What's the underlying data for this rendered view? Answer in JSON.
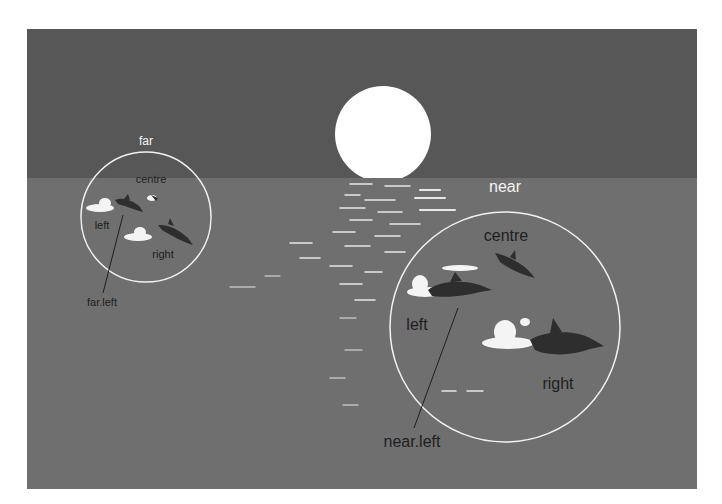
{
  "colors": {
    "background": "#ffffff",
    "sky": "#575757",
    "sea": "#6f6f6f",
    "sun": "#ffffff",
    "circle_stroke": "#f2f2f2",
    "label_dark": "#1e1e1e",
    "label_light": "#f5f5f5",
    "dolphin": "#2e2e2e",
    "splash": "#f4f4f4"
  },
  "groups": {
    "far": {
      "title": "far",
      "members": {
        "centre": "centre",
        "left": "left",
        "right": "right"
      },
      "pointer_label": "far.left"
    },
    "near": {
      "title": "near",
      "members": {
        "centre": "centre",
        "left": "left",
        "right": "right"
      },
      "pointer_label": "near.left"
    }
  }
}
